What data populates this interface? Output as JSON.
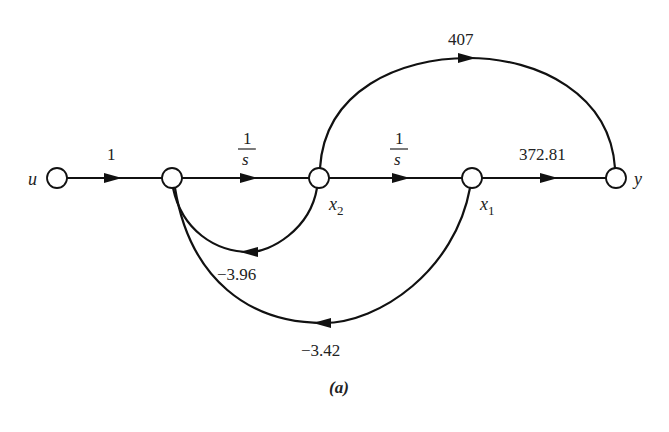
{
  "diagram": {
    "type": "signal-flow-graph",
    "caption": "(a)",
    "nodes": [
      {
        "id": "u",
        "label": "u",
        "x": 57,
        "y": 178
      },
      {
        "id": "n1",
        "label": "",
        "x": 172,
        "y": 178
      },
      {
        "id": "x2",
        "label": "x",
        "sub": "2",
        "x": 319,
        "y": 178
      },
      {
        "id": "x1",
        "label": "x",
        "sub": "1",
        "x": 472,
        "y": 178
      },
      {
        "id": "y",
        "label": "y",
        "x": 616,
        "y": 178
      }
    ],
    "edges": [
      {
        "from": "u",
        "to": "n1",
        "gain": "1"
      },
      {
        "from": "n1",
        "to": "x2",
        "gain_num": "1",
        "gain_den": "s"
      },
      {
        "from": "x2",
        "to": "x1",
        "gain_num": "1",
        "gain_den": "s"
      },
      {
        "from": "x1",
        "to": "y",
        "gain": "372.81"
      },
      {
        "from": "x2",
        "to": "y",
        "gain": "407"
      },
      {
        "from": "x2",
        "to": "n1",
        "gain": "−3.96"
      },
      {
        "from": "x1",
        "to": "n1",
        "gain": "−3.42"
      }
    ]
  }
}
